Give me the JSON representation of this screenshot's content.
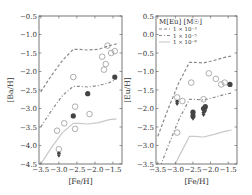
{
  "chart_data": [
    {
      "type": "scatter",
      "panel": "left",
      "xlabel": "[Fe/H]",
      "ylabel": "[Ba/H]",
      "xlim": [
        -3.55,
        -1.25
      ],
      "ylim": [
        -4.5,
        -0.5
      ],
      "xticks": [
        -3.5,
        -3.0,
        -2.5,
        -2.0,
        -1.5
      ],
      "xtick_labels": [
        "−3.5",
        "−3.0",
        "−2.5",
        "−2.0",
        "−1.5"
      ],
      "yticks": [
        -0.5,
        -1.0,
        -1.5,
        -2.0,
        -2.5,
        -3.0,
        -3.5,
        -4.0,
        -4.5
      ],
      "ytick_labels": [
        "−0.5",
        "−1.0",
        "−1.5",
        "−2.0",
        "−2.5",
        "−3.0",
        "−3.5",
        "−4.0",
        "−4.5"
      ],
      "grid": false,
      "lines": [
        {
          "name": "1×10⁻⁴",
          "style": "dashed",
          "x": [
            -3.5,
            -3.2,
            -2.9,
            -2.6,
            -2.45,
            -2.2,
            -1.9,
            -1.6,
            -1.4
          ],
          "y": [
            -2.55,
            -2.1,
            -1.7,
            -1.4,
            -1.4,
            -1.42,
            -1.4,
            -1.3,
            -1.25
          ]
        },
        {
          "name": "1×10⁻⁵",
          "style": "dashdot",
          "x": [
            -3.5,
            -3.2,
            -2.9,
            -2.6,
            -2.45,
            -2.2,
            -1.9,
            -1.6,
            -1.4
          ],
          "y": [
            -3.5,
            -3.05,
            -2.65,
            -2.4,
            -2.4,
            -2.42,
            -2.38,
            -2.3,
            -2.2
          ]
        },
        {
          "name": "1×10⁻⁶",
          "style": "solid",
          "x": [
            -3.5,
            -3.2,
            -2.9,
            -2.6,
            -2.45,
            -2.2,
            -1.9,
            -1.6,
            -1.4
          ],
          "y": [
            -4.5,
            -4.05,
            -3.65,
            -3.4,
            -3.4,
            -3.42,
            -3.38,
            -3.3,
            -3.28
          ]
        }
      ],
      "series": [
        {
          "name": "open circles",
          "marker": "open-circle",
          "x": [
            -1.65,
            -1.55,
            -1.45,
            -1.8,
            -1.7,
            -1.75,
            -2.6,
            -2.55,
            -3.05,
            -2.15,
            -2.85,
            -2.55,
            -3.0
          ],
          "y": [
            -1.3,
            -1.5,
            -1.45,
            -1.6,
            -1.8,
            -1.95,
            -2.15,
            -2.95,
            -3.6,
            -3.15,
            -3.4,
            -3.55,
            -4.1
          ]
        },
        {
          "name": "filled circles",
          "marker": "filled-circle",
          "x": [
            -1.45,
            -2.2,
            -2.6
          ],
          "y": [
            -2.15,
            -2.6,
            -3.2
          ]
        },
        {
          "name": "upper limits",
          "marker": "filled-arrow",
          "x": [
            -3.0
          ],
          "y": [
            -4.25
          ]
        }
      ]
    },
    {
      "type": "scatter",
      "panel": "right",
      "xlabel": "[Fe/H]",
      "ylabel": "[Eu/H]",
      "xlim": [
        -3.55,
        -1.25
      ],
      "ylim": [
        -3.5,
        0.5
      ],
      "xticks": [
        -3.5,
        -3.0,
        -2.5,
        -2.0,
        -1.5
      ],
      "xtick_labels": [
        "−3.5",
        "−3.0",
        "−2.5",
        "−2.0",
        "−1.5"
      ],
      "yticks": [
        0.5,
        0.0,
        -0.5,
        -1.0,
        -1.5,
        -2.0,
        -2.5,
        -3.0,
        -3.5
      ],
      "ytick_labels": [
        "0.5",
        "0.0",
        "−0.5",
        "−1.0",
        "−1.5",
        "−2.0",
        "−2.5",
        "−3.0",
        "−3.5"
      ],
      "grid": false,
      "legend": {
        "title": "M[Eu] [M☉]",
        "position": "upper left",
        "entries": [
          {
            "label": "1 × 10⁻⁴",
            "style": "dashed"
          },
          {
            "label": "1 × 10⁻⁵",
            "style": "dashdot"
          },
          {
            "label": "1 × 10⁻⁶",
            "style": "solid"
          }
        ]
      },
      "lines": [
        {
          "name": "1×10⁻⁴",
          "style": "dashed",
          "x": [
            -3.5,
            -3.2,
            -2.9,
            -2.6,
            -2.45,
            -2.2,
            -1.9,
            -1.6,
            -1.4
          ],
          "y": [
            -2.75,
            -2.0,
            -1.3,
            -0.75,
            -0.75,
            -0.77,
            -0.7,
            -0.62,
            -0.58
          ]
        },
        {
          "name": "1×10⁻⁵",
          "style": "dashdot",
          "x": [
            -3.5,
            -3.2,
            -2.9,
            -2.6,
            -2.45,
            -2.2,
            -1.9,
            -1.6,
            -1.4
          ],
          "y": [
            -3.75,
            -3.0,
            -2.3,
            -1.75,
            -1.75,
            -1.77,
            -1.7,
            -1.62,
            -1.58
          ]
        },
        {
          "name": "1×10⁻⁶",
          "style": "solid",
          "x": [
            -3.2,
            -2.9,
            -2.6,
            -2.45,
            -2.2,
            -1.9,
            -1.6,
            -1.4
          ],
          "y": [
            -3.9,
            -3.3,
            -2.75,
            -2.75,
            -2.77,
            -2.7,
            -2.62,
            -2.58
          ]
        }
      ],
      "series": [
        {
          "name": "open circles",
          "marker": "open-circle",
          "x": [
            -2.05,
            -1.85,
            -1.7,
            -1.6,
            -2.95,
            -2.55,
            -2.8,
            -2.2,
            -2.95
          ],
          "y": [
            -1.05,
            -1.2,
            -1.35,
            -1.3,
            -1.7,
            -1.3,
            -1.8,
            -1.75,
            -2.65
          ]
        },
        {
          "name": "filled circles",
          "marker": "filled-circle",
          "x": [
            -1.45,
            -2.5,
            -2.5,
            -2.2,
            -2.15
          ],
          "y": [
            -1.35,
            -2.1,
            -2.2,
            -2.0,
            -1.95
          ]
        },
        {
          "name": "upper limits",
          "marker": "filled-arrow",
          "x": [
            -2.95,
            -2.5,
            -2.2,
            -2.15
          ],
          "y": [
            -1.85,
            -2.25,
            -2.15,
            -2.05
          ]
        }
      ]
    }
  ],
  "panels": {
    "left": {
      "ylabel": "[Ba/H]",
      "xlabel": "[Fe/H]"
    },
    "right": {
      "ylabel": "[Eu/H]",
      "xlabel": "[Fe/H]",
      "legend_title": "M[Eu] [M☉]"
    }
  }
}
